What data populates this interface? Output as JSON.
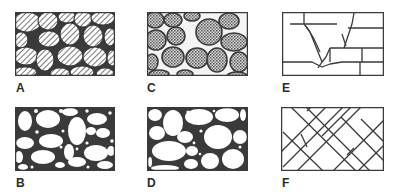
{
  "diagram": {
    "panels": [
      {
        "id": "A",
        "label": "A",
        "pattern": "hatched-grains-tight",
        "description": "Closely packed diagonally hatched grains"
      },
      {
        "id": "B",
        "label": "B",
        "pattern": "open-grains-with-matrix",
        "description": "Open white grains in dark matrix with small pores"
      },
      {
        "id": "C",
        "label": "C",
        "pattern": "dotted-grains-tight",
        "description": "Closely packed stippled grains"
      },
      {
        "id": "D",
        "label": "D",
        "pattern": "open-grains-cemented",
        "description": "Rounded open grains with cement between"
      },
      {
        "id": "E",
        "label": "E",
        "pattern": "fractured-blocks",
        "description": "Blocky rock with irregular fractures"
      },
      {
        "id": "F",
        "label": "F",
        "pattern": "cross-fractures",
        "description": "Intersecting diagonal fractures"
      }
    ],
    "colors": {
      "ink": "#3a3a3a",
      "background": "#ffffff"
    }
  }
}
